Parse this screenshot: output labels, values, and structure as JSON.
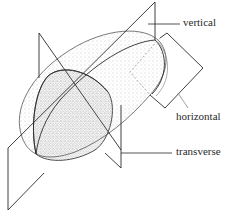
{
  "diagram": {
    "labels": {
      "vertical": "vertical",
      "horizontal": "horizontal",
      "transverse": "transverse"
    },
    "colors": {
      "line": "#2a2a2a",
      "stipple": "#6e6e6e",
      "background": "#ffffff"
    }
  }
}
